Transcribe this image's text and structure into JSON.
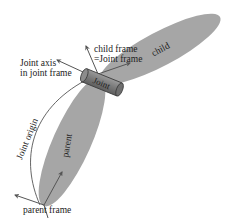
{
  "diagram": {
    "labels": {
      "child_frame_line1": "child frame",
      "child_frame_line2": "=Joint frame",
      "child": "child",
      "joint_axis_line1": "Joint axis",
      "joint_axis_line2": "in joint frame",
      "joint": "Joint",
      "joint_origin": "Joint origin",
      "parent": "parent",
      "parent_frame": "parent frame"
    },
    "colors": {
      "link_fill": "#a6a6a6",
      "joint_fill": "#7f7f7f",
      "joint_stroke": "#3a3a3a",
      "arrow": "#555555",
      "text": "#222222",
      "background": "#ffffff"
    },
    "elements": [
      {
        "id": "child-link",
        "shape": "ellipse"
      },
      {
        "id": "parent-link",
        "shape": "ellipse"
      },
      {
        "id": "joint",
        "shape": "cylinder"
      },
      {
        "id": "child-frame-arrows",
        "shape": "axes"
      },
      {
        "id": "parent-frame-arrows",
        "shape": "axes"
      },
      {
        "id": "joint-axis-arrow",
        "shape": "arrow"
      },
      {
        "id": "joint-origin-arc",
        "shape": "curved-arrow"
      }
    ]
  }
}
